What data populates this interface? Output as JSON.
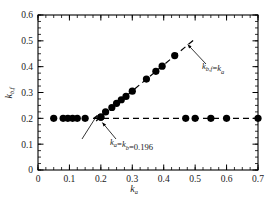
{
  "chart_data": {
    "type": "scatter",
    "title": "",
    "xlabel": "k_a",
    "ylabel": "k_b,f",
    "xlim": [
      0,
      0.7
    ],
    "ylim": [
      0,
      0.6
    ],
    "xticks": [
      0,
      0.1,
      0.2,
      0.3,
      0.4,
      0.5,
      0.6,
      0.7
    ],
    "xtick_labels": [
      "0",
      "0.1",
      "0.2",
      "0.3",
      "0.4",
      "0.5",
      "0.6",
      "0.7"
    ],
    "yticks": [
      0,
      0.1,
      0.2,
      0.3,
      0.4,
      0.5,
      0.6
    ],
    "ytick_labels": [
      "0",
      "0.1",
      "0.2",
      "0.3",
      "0.4",
      "0.5",
      "0.6"
    ],
    "xtick_minor_step": 0.025,
    "ytick_minor_step": 0.025,
    "grid": false,
    "legend": false,
    "series": [
      {
        "name": "lower-branch",
        "marker": "filled-circle",
        "color": "#000000",
        "points": [
          {
            "x": 0.05,
            "y": 0.2
          },
          {
            "x": 0.08,
            "y": 0.2
          },
          {
            "x": 0.095,
            "y": 0.2
          },
          {
            "x": 0.11,
            "y": 0.2
          },
          {
            "x": 0.125,
            "y": 0.2
          },
          {
            "x": 0.15,
            "y": 0.2
          },
          {
            "x": 0.2,
            "y": 0.205
          },
          {
            "x": 0.47,
            "y": 0.2
          },
          {
            "x": 0.5,
            "y": 0.2
          },
          {
            "x": 0.55,
            "y": 0.2
          },
          {
            "x": 0.6,
            "y": 0.2
          },
          {
            "x": 0.7,
            "y": 0.2
          }
        ]
      },
      {
        "name": "upper-branch",
        "marker": "filled-circle",
        "color": "#000000",
        "points": [
          {
            "x": 0.2,
            "y": 0.205
          },
          {
            "x": 0.215,
            "y": 0.225
          },
          {
            "x": 0.235,
            "y": 0.242
          },
          {
            "x": 0.25,
            "y": 0.258
          },
          {
            "x": 0.265,
            "y": 0.272
          },
          {
            "x": 0.28,
            "y": 0.285
          },
          {
            "x": 0.3,
            "y": 0.305
          },
          {
            "x": 0.345,
            "y": 0.352
          },
          {
            "x": 0.375,
            "y": 0.382
          },
          {
            "x": 0.395,
            "y": 0.402
          },
          {
            "x": 0.435,
            "y": 0.443
          }
        ]
      }
    ],
    "reference_lines": [
      {
        "name": "horizontal-asymptote",
        "style": "dashed",
        "color": "#000000",
        "from": {
          "x": 0.175,
          "y": 0.2
        },
        "to": {
          "x": 0.7,
          "y": 0.2
        }
      },
      {
        "name": "identity-line",
        "style": "dashed",
        "color": "#000000",
        "from": {
          "x": 0.185,
          "y": 0.19
        },
        "to": {
          "x": 0.5,
          "y": 0.508
        }
      }
    ],
    "annotations": [
      {
        "name": "branch-point-annotation",
        "text": "k_a=k_b=0.196",
        "text_parts": [
          {
            "main": "k",
            "sub": "a"
          },
          {
            "op": "="
          },
          {
            "main": "k",
            "sub": "b"
          },
          {
            "op": "=0.196"
          }
        ],
        "value": 0.196,
        "target": {
          "x": 0.2,
          "y": 0.205
        }
      },
      {
        "name": "identity-line-annotation",
        "text": "k_b,f=k_a",
        "text_parts": [
          {
            "main": "k",
            "sub": "b,f"
          },
          {
            "op": "="
          },
          {
            "main": "k",
            "sub": "a"
          }
        ],
        "target": {
          "x": 0.47,
          "y": 0.478
        }
      }
    ]
  },
  "axes": {
    "x_title_main": "k",
    "x_title_sub": "a",
    "y_title_main": "k",
    "y_title_sub": "b,f"
  }
}
